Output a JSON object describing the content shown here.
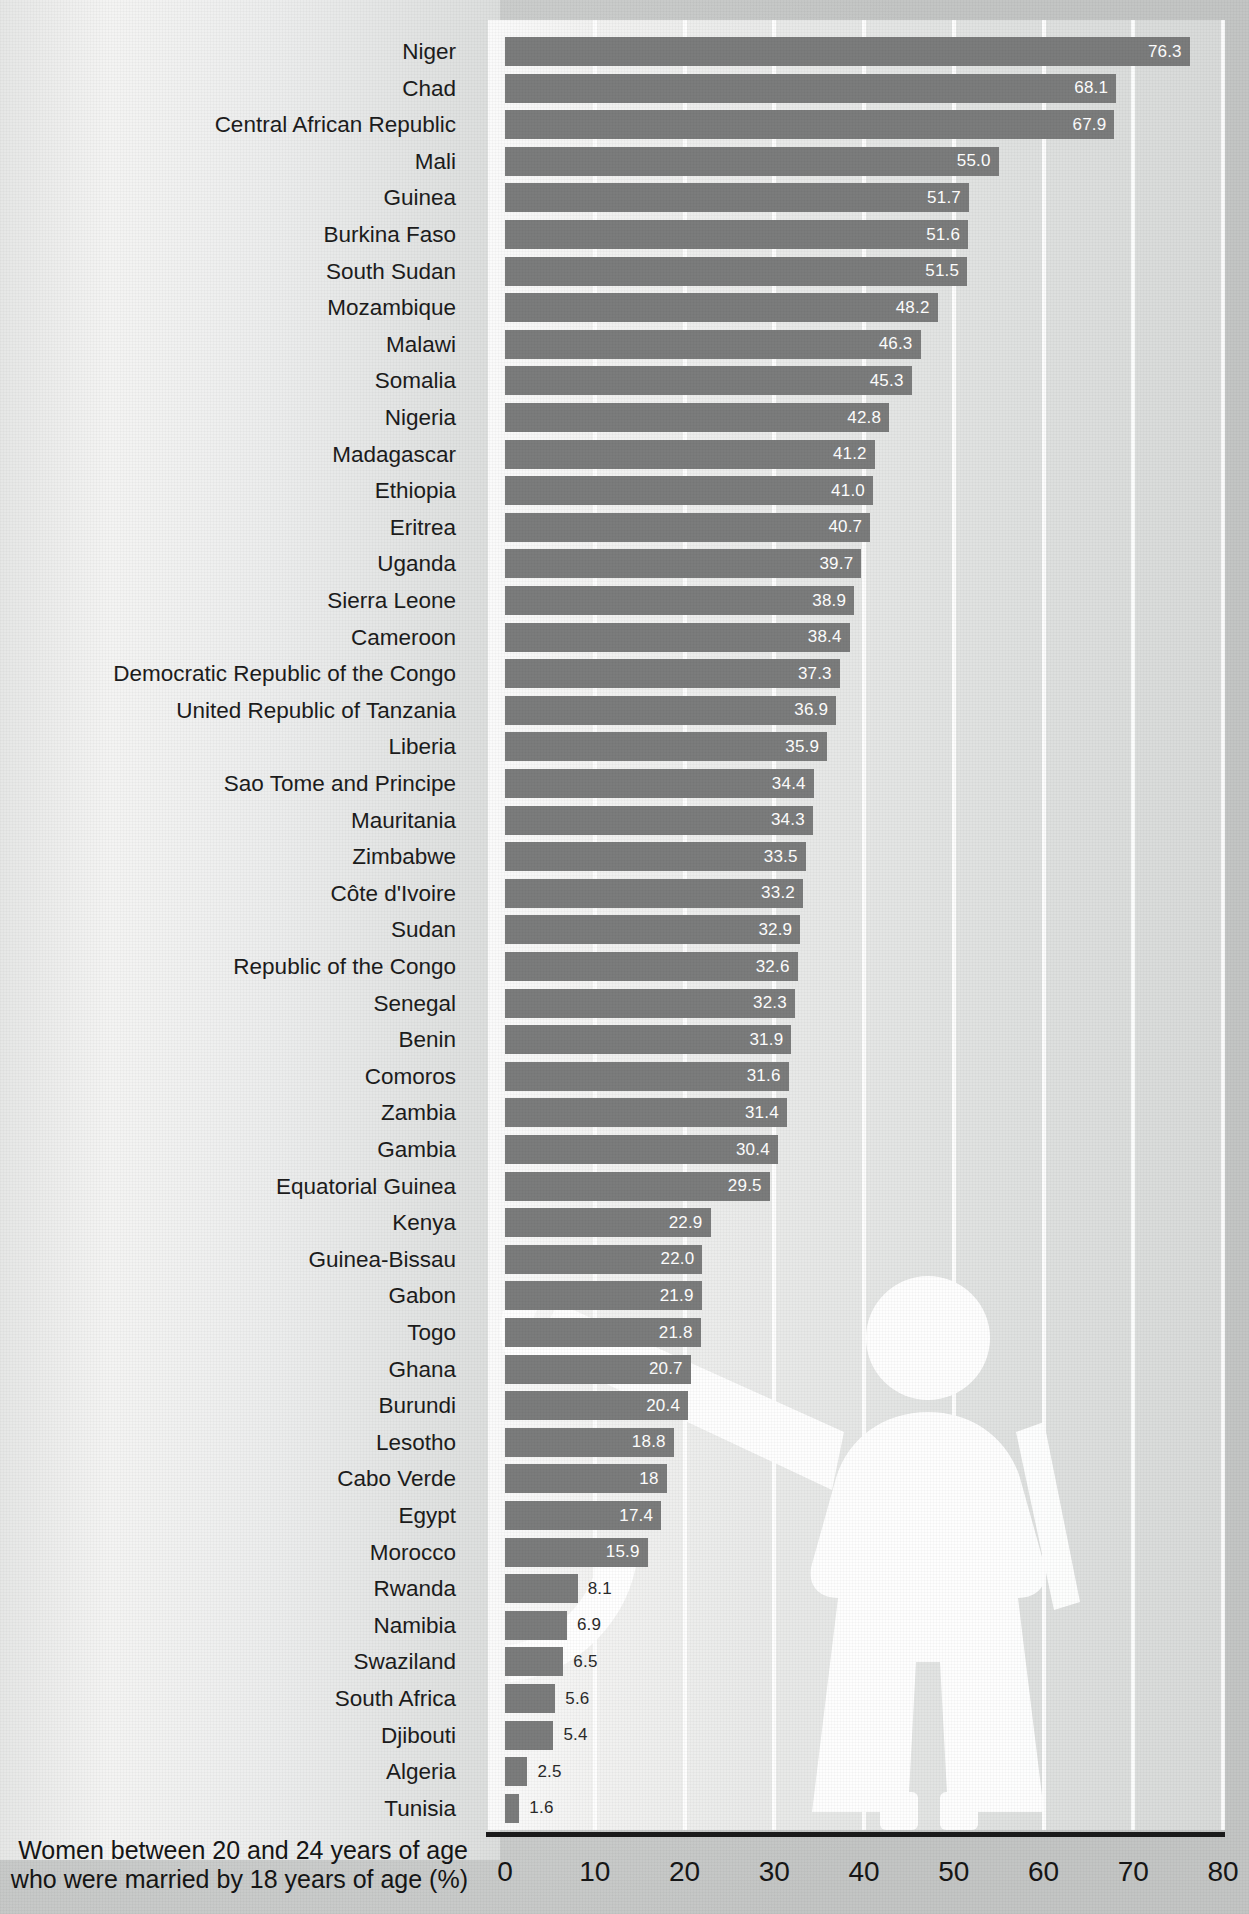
{
  "chart_data": {
    "type": "bar",
    "orientation": "horizontal",
    "title": "",
    "xlabel": "Women between 20 and 24 years of age who were married by 18 years of age (%)",
    "ylabel": "",
    "xlim": [
      0,
      80
    ],
    "xticks": [
      0,
      10,
      20,
      30,
      40,
      50,
      60,
      70,
      80
    ],
    "grid": true,
    "legend": "none",
    "bar_color": "#7b7c7c",
    "categories": [
      "Niger",
      "Chad",
      "Central African Republic",
      "Mali",
      "Guinea",
      "Burkina Faso",
      "South Sudan",
      "Mozambique",
      "Malawi",
      "Somalia",
      "Nigeria",
      "Madagascar",
      "Ethiopia",
      "Eritrea",
      "Uganda",
      "Sierra Leone",
      "Cameroon",
      "Democratic Republic of the Congo",
      "United Republic of Tanzania",
      "Liberia",
      "Sao Tome and Principe",
      "Mauritania",
      "Zimbabwe",
      "Côte d'Ivoire",
      "Sudan",
      "Republic of the Congo",
      "Senegal",
      "Benin",
      "Comoros",
      "Zambia",
      "Gambia",
      "Equatorial Guinea",
      "Kenya",
      "Guinea-Bissau",
      "Gabon",
      "Togo",
      "Ghana",
      "Burundi",
      "Lesotho",
      "Cabo Verde",
      "Egypt",
      "Morocco",
      "Rwanda",
      "Namibia",
      "Swaziland",
      "South Africa",
      "Djibouti",
      "Algeria",
      "Tunisia"
    ],
    "values": [
      76.3,
      68.1,
      67.9,
      55.0,
      51.7,
      51.6,
      51.5,
      48.2,
      46.3,
      45.3,
      42.8,
      41.2,
      41.0,
      40.7,
      39.7,
      38.9,
      38.4,
      37.3,
      36.9,
      35.9,
      34.4,
      34.3,
      33.5,
      33.2,
      32.9,
      32.6,
      32.3,
      31.9,
      31.6,
      31.4,
      30.4,
      29.5,
      22.9,
      22.0,
      21.9,
      21.8,
      20.7,
      20.4,
      18.8,
      18,
      17.4,
      15.9,
      8.1,
      6.9,
      6.5,
      5.6,
      5.4,
      2.5,
      1.6
    ],
    "value_labels": [
      "76.3",
      "68.1",
      "67.9",
      "55.0",
      "51.7",
      "51.6",
      "51.5",
      "48.2",
      "46.3",
      "45.3",
      "42.8",
      "41.2",
      "41.0",
      "40.7",
      "39.7",
      "38.9",
      "38.4",
      "37.3",
      "36.9",
      "35.9",
      "34.4",
      "34.3",
      "33.5",
      "33.2",
      "32.9",
      "32.6",
      "32.3",
      "31.9",
      "31.6",
      "31.4",
      "30.4",
      "29.5",
      "22.9",
      "22.0",
      "21.9",
      "21.8",
      "20.7",
      "20.4",
      "18.8",
      "18",
      "17.4",
      "15.9",
      "8.1",
      "6.9",
      "6.5",
      "5.6",
      "5.4",
      "2.5",
      "1.6"
    ]
  },
  "caption": {
    "line1": "Women between 20 and 24 years of age",
    "line2": "who were married by 18 years of age (%)"
  },
  "watermark": {
    "name": "girl-silhouette",
    "color": "#ffffff"
  }
}
